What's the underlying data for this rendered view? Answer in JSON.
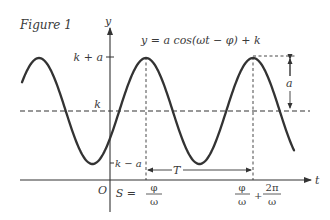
{
  "figure": {
    "title": "Figure 1",
    "equation": "y = a cos(ωt − φ) + k"
  },
  "axes": {
    "x_label": "t",
    "y_label": "y",
    "origin_label": "O"
  },
  "y_ticks": {
    "max": "k + a",
    "mid": "k",
    "min": "k − a"
  },
  "x_ticks": {
    "shift_prefix": "S =",
    "shift_num": "φ",
    "shift_den": "ω",
    "end_num1": "φ",
    "end_den1": "ω",
    "end_plus": "+",
    "end_num2": "2π",
    "end_den2": "ω"
  },
  "annotations": {
    "amplitude": "a",
    "period": "T"
  },
  "colors": {
    "curve": "#333333",
    "axis": "#333333",
    "dash": "#333333",
    "text": "#3a3a3a"
  },
  "chart_data": {
    "type": "line",
    "title": "Figure 1",
    "function": "y = a cos(ωt − φ) + k",
    "xlabel": "t",
    "ylabel": "y",
    "levels": [
      "k − a",
      "k",
      "k + a"
    ],
    "x_marks": [
      "S = φ/ω",
      "φ/ω + 2π/ω"
    ],
    "period_label": "T",
    "amplitude_label": "a",
    "grid": false
  }
}
